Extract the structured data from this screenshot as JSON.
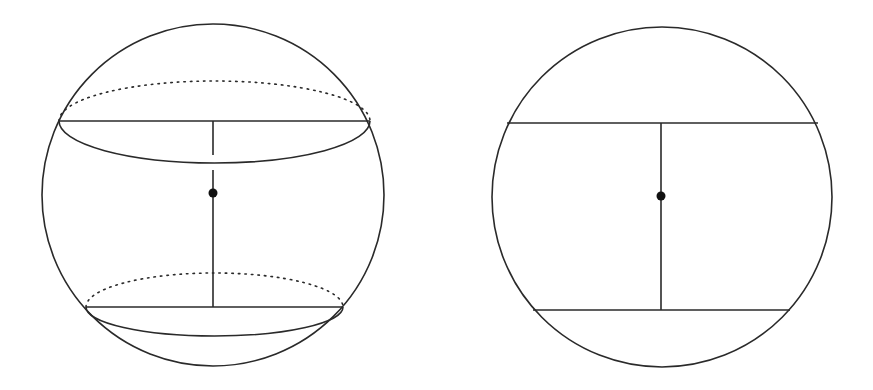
{
  "figure": {
    "width": 873,
    "height": 390,
    "background": "#ffffff",
    "stroke_color": "#2a2a2a",
    "dot_color": "#111111"
  },
  "panels": [
    {
      "name": "sphere-3d-view",
      "description": "Sphere with two parallel cross-sectional circles drawn in perspective",
      "outline": {
        "cx": 213,
        "cy": 195,
        "r": 171
      },
      "upper_section": {
        "y": 121,
        "x1": 59,
        "x2": 370,
        "front_ry": 42,
        "back_ry": 40
      },
      "lower_section": {
        "y": 307,
        "x1": 86,
        "x2": 343,
        "front_ry": 29,
        "back_ry": 34
      },
      "center_dot": {
        "cx": 213,
        "cy": 193,
        "r": 4.5
      },
      "axis": {
        "x": 213,
        "y_top": 121,
        "y_bottom": 307,
        "gap_from": 155,
        "gap_to": 170
      }
    },
    {
      "name": "sphere-cross-section-view",
      "description": "Side view of sphere with two parallel chords and connecting axis",
      "outline": {
        "cx": 662,
        "cy": 197,
        "r": 170
      },
      "upper_chord": {
        "y": 123,
        "x1": 507,
        "x2": 818
      },
      "lower_chord": {
        "y": 310,
        "x1": 533,
        "x2": 790
      },
      "center_dot": {
        "cx": 661,
        "cy": 196,
        "r": 4.5
      },
      "axis": {
        "x": 661,
        "y_top": 123,
        "y_bottom": 310
      }
    }
  ]
}
